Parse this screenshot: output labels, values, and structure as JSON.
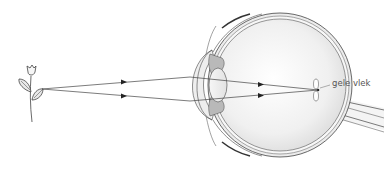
{
  "diagram": {
    "elements": {
      "object": "flower-icon",
      "rays": 2,
      "eye": "eye-cross-section"
    },
    "labels": {
      "macula": "gele vlek"
    },
    "colors": {
      "stroke": "#444444",
      "fill_light": "#f1f1f1",
      "fill_mid": "#d6d6d6",
      "fill_dark": "#b9b9b9",
      "label": "#555555"
    }
  }
}
